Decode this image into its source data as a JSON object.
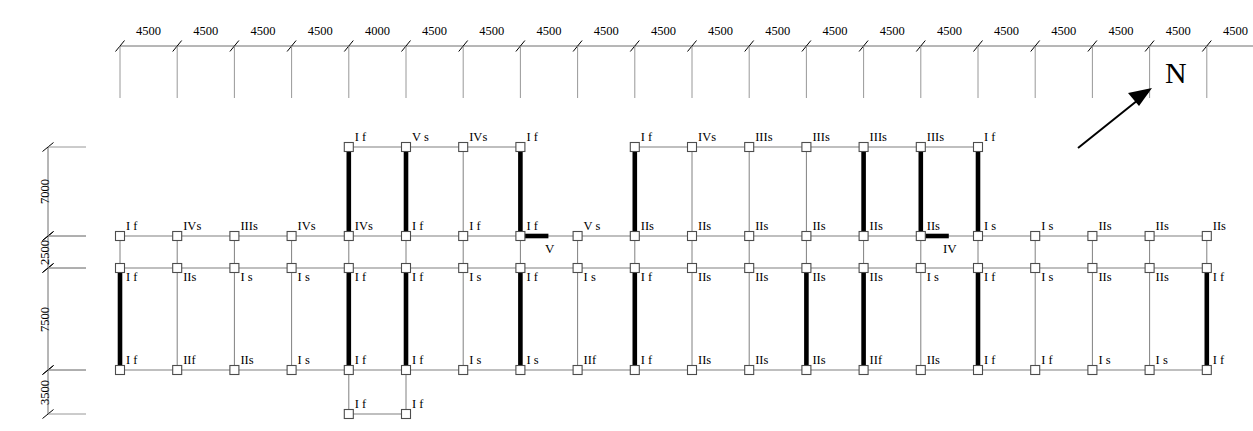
{
  "drawing": {
    "title": "Structural framing plan",
    "north_label": "N",
    "grid": {
      "origin_x": 120,
      "spacing": 57.2,
      "count": 20,
      "top_dim_labels": [
        "4500",
        "4500",
        "4500",
        "4500",
        "4000",
        "4500",
        "4500",
        "4500",
        "4500",
        "4500",
        "4500",
        "4500",
        "4500",
        "4500",
        "4500",
        "4500",
        "4500",
        "4500",
        "4500",
        "4500"
      ]
    },
    "vertical_dimensions": [
      {
        "label": "7000",
        "y_top": 147,
        "y_bottom": 236
      },
      {
        "label": "2500",
        "y_top": 236,
        "y_bottom": 268
      },
      {
        "label": "7500",
        "y_top": 268,
        "y_bottom": 370
      },
      {
        "label": "3500",
        "y_top": 370,
        "y_bottom": 414
      }
    ],
    "rows": {
      "upper": 147,
      "axis_a": 236,
      "axis_b": 268,
      "axis_c": 370,
      "annex": 414
    },
    "markers": [
      {
        "text": "V",
        "x": 545,
        "y": 241
      },
      {
        "text": "IV",
        "x": 943,
        "y": 241
      }
    ],
    "upper_block_left": {
      "columns": [
        4,
        5,
        6,
        7
      ],
      "labels": [
        "I f",
        "V s",
        "IVs",
        "I f"
      ]
    },
    "upper_block_right": {
      "columns": [
        9,
        10,
        11,
        12,
        13,
        14,
        15
      ],
      "labels": [
        "I f",
        "IVs",
        "IIIs",
        "IIIs",
        "IIIs",
        "IIIs",
        "I f"
      ]
    },
    "axis_a_labels": [
      "I f",
      "IVs",
      "IIIs",
      "IVs",
      "IVs",
      "I f",
      "I f",
      "I f",
      "V s",
      "IIs",
      "IIs",
      "IIs",
      "IIs",
      "IIs",
      "IIs",
      "I s",
      "I s",
      "IIs",
      "IIs",
      "IIs"
    ],
    "axis_b_labels": [
      "I f",
      "IIs",
      "I s",
      "I s",
      "I f",
      "I f",
      "I s",
      "I f",
      "I s",
      "I f",
      "IIs",
      "IIs",
      "IIs",
      "IIs",
      "I s",
      "I f",
      "I s",
      "IIs",
      "IIs",
      "I f"
    ],
    "axis_c_labels": [
      "I f",
      "IIf",
      "IIs",
      "I s",
      "I f",
      "I f",
      "I s",
      "I s",
      "IIf",
      "I f",
      "IIs",
      "IIs",
      "IIs",
      "IIf",
      "IIs",
      "I f",
      "I f",
      "I s",
      "I s",
      "I f"
    ],
    "annex_labels": [
      "I f",
      "I f"
    ],
    "annex_columns": [
      4,
      5
    ],
    "walls_upper_left": [
      4,
      5,
      7
    ],
    "walls_upper_right": [
      9,
      13,
      14,
      15
    ],
    "walls_axis_b": [
      0,
      4,
      5,
      7,
      9,
      12,
      13,
      15,
      19
    ],
    "wall_stubs": [
      {
        "column": 7,
        "row": "axis_a",
        "direction": "right"
      },
      {
        "column": 14,
        "row": "axis_a",
        "direction": "right"
      }
    ],
    "colors": {
      "line": "#808080",
      "wall": "#000000",
      "text": "#000000",
      "node_fill": "#ffffff",
      "node_stroke": "#4d4d4d"
    }
  }
}
